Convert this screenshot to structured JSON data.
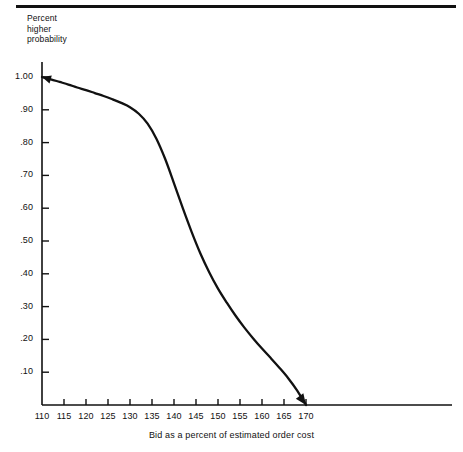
{
  "figure": {
    "top_rule": "horizontal-rule",
    "background_color": "#ffffff",
    "ink_color": "#111111"
  },
  "chart_data": {
    "type": "line",
    "title": "",
    "subtitle": "",
    "xlabel": "Bid as a percent of estimated order cost",
    "ylabel": "Percent higher probability",
    "ylabel_lines": [
      "Percent",
      "higher",
      "probability"
    ],
    "xlim": [
      110,
      172
    ],
    "ylim": [
      0,
      1.0
    ],
    "grid": false,
    "legend": "none",
    "x_ticks": [
      110,
      115,
      120,
      125,
      130,
      135,
      140,
      145,
      150,
      155,
      160,
      165,
      170
    ],
    "x_tick_labels": [
      "110",
      "115",
      "120",
      "125",
      "130",
      "135",
      "140",
      "145",
      "150",
      "155",
      "160",
      "165",
      "170"
    ],
    "y_ticks": [
      1.0,
      0.9,
      0.8,
      0.7,
      0.6,
      0.5,
      0.4,
      0.3,
      0.2,
      0.1
    ],
    "y_tick_labels": [
      "1.00",
      ".90",
      ".80",
      ".70",
      ".60",
      ".50",
      ".40",
      ".30",
      ".20",
      ".10"
    ],
    "series": [
      {
        "name": "Percent higher probability",
        "x": [
          110,
          112,
          114,
          116,
          118,
          120,
          122,
          124,
          126,
          128,
          130,
          132,
          134,
          136,
          138,
          140,
          142,
          144,
          146,
          148,
          150,
          152,
          154,
          156,
          158,
          160,
          162,
          164,
          166,
          168,
          170
        ],
        "values": [
          1.0,
          0.993,
          0.985,
          0.977,
          0.968,
          0.96,
          0.951,
          0.942,
          0.932,
          0.921,
          0.908,
          0.888,
          0.858,
          0.812,
          0.75,
          0.676,
          0.6,
          0.528,
          0.462,
          0.405,
          0.355,
          0.312,
          0.272,
          0.236,
          0.203,
          0.172,
          0.143,
          0.113,
          0.081,
          0.044,
          0.0
        ]
      }
    ],
    "annotations": [
      {
        "name": "start-arrowhead",
        "at_x": 110,
        "at_y": 1.0,
        "points": "left"
      },
      {
        "name": "end-arrowhead",
        "at_x": 170,
        "at_y": 0.0,
        "points": "down-right"
      }
    ]
  }
}
